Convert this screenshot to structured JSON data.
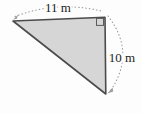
{
  "diagram": {
    "type": "right-triangle-with-measurements",
    "labels": {
      "top_side": "11 m",
      "right_side": "10 m"
    },
    "measurements": {
      "top_side": {
        "value": 11,
        "unit": "m"
      },
      "right_side": {
        "value": 10,
        "unit": "m"
      }
    },
    "right_angle_marker_position": "top-right corner",
    "colors": {
      "triangle_fill": "#d6d6d6",
      "triangle_stroke": "#4b4b4b",
      "arc": "#9a9a9a",
      "label_text": "#1c1c1c",
      "background": "#fdfdfd"
    }
  }
}
